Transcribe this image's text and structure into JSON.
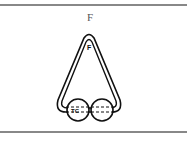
{
  "figure": {
    "label": "F",
    "inner_label": "F",
    "circle_label": "TC",
    "colors": {
      "stroke": "#111111",
      "rule": "#888888",
      "label": "#555555"
    }
  }
}
